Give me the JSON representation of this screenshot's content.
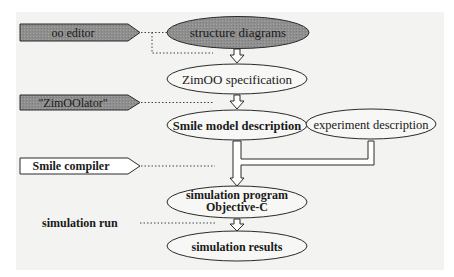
{
  "diagram": {
    "colors": {
      "background": "#f3f3f1",
      "stroke": "#2a2a2a",
      "tool_fill_dark": "#8f8f8f",
      "tool_fill_light": "#ffffff",
      "ellipse_fill_dark": "#8a8a8a",
      "ellipse_fill_light": "#f7f7f5"
    },
    "tools": [
      {
        "id": "oo-editor",
        "label": "oo editor",
        "fill": "dark"
      },
      {
        "id": "zimoolator",
        "label": "\"ZimOOlator\"",
        "fill": "dark"
      },
      {
        "id": "smile-compiler",
        "label": "Smile compiler",
        "fill": "light"
      }
    ],
    "process_label": "simulation run",
    "artifacts": [
      {
        "id": "structure-diagrams",
        "label": "structure diagrams",
        "fill": "dark"
      },
      {
        "id": "zimoo-specification",
        "label": "ZimOO specification",
        "fill": "light"
      },
      {
        "id": "smile-model-description",
        "label": "Smile model description",
        "fill": "light"
      },
      {
        "id": "experiment-description",
        "label": "experiment description",
        "fill": "light"
      },
      {
        "id": "simulation-program",
        "label_line1": "simulation program",
        "label_line2": "Objective-C",
        "fill": "light"
      },
      {
        "id": "simulation-results",
        "label": "simulation results",
        "fill": "light"
      }
    ]
  }
}
